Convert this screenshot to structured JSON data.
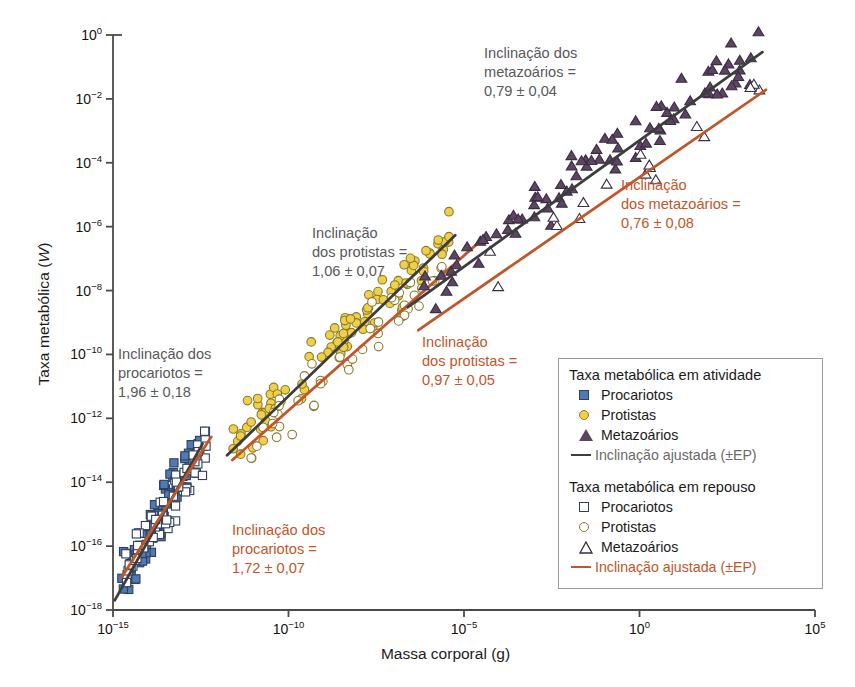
{
  "chart_data": {
    "type": "scatter",
    "title": "",
    "xlabel": "Massa corporal (g)",
    "ylabel": "Taxa metabólica (W)",
    "ylabel_italic": "W",
    "xscale": "log",
    "yscale": "log",
    "xlim": [
      1e-15,
      100000.0
    ],
    "ylim": [
      1e-18,
      1.0
    ],
    "xticks": [
      "10-15",
      "10-10",
      "10-5",
      "100",
      "105"
    ],
    "xtick_labels": [
      {
        "mantissa": "10",
        "exponent": "−15"
      },
      {
        "mantissa": "10",
        "exponent": "−10"
      },
      {
        "mantissa": "10",
        "exponent": "−5"
      },
      {
        "mantissa": "10",
        "exponent": "0"
      },
      {
        "mantissa": "10",
        "exponent": "5"
      }
    ],
    "ytick_labels": [
      {
        "mantissa": "10",
        "exponent": "0"
      },
      {
        "mantissa": "10",
        "exponent": "−2"
      },
      {
        "mantissa": "10",
        "exponent": "−4"
      },
      {
        "mantissa": "10",
        "exponent": "−6"
      },
      {
        "mantissa": "10",
        "exponent": "−8"
      },
      {
        "mantissa": "10",
        "exponent": "−10"
      },
      {
        "mantissa": "10",
        "exponent": "−12"
      },
      {
        "mantissa": "10",
        "exponent": "−14"
      },
      {
        "mantissa": "10",
        "exponent": "−16"
      },
      {
        "mantissa": "10",
        "exponent": "−18"
      }
    ],
    "grid": false,
    "legend_position": "lower-right-inside",
    "series": [
      {
        "name": "Procariotos (atividade)",
        "marker": "filled-square",
        "color": "#4e7ab5",
        "edge": "#2f3f5c",
        "n": 70
      },
      {
        "name": "Protistas (atividade)",
        "marker": "filled-circle",
        "color": "#f0cf4b",
        "edge": "#8a7a2a",
        "n": 80
      },
      {
        "name": "Metazoários (atividade)",
        "marker": "filled-triangle",
        "color": "#5b4563",
        "edge": "#3b2c41",
        "n": 70
      },
      {
        "name": "Procariotos (repouso)",
        "marker": "open-square",
        "color": "#ffffff",
        "edge": "#2f3f5c",
        "n": 60
      },
      {
        "name": "Protistas (repouso)",
        "marker": "open-circle",
        "color": "#ffffff",
        "edge": "#8a7a2a",
        "n": 40
      },
      {
        "name": "Metazoários (repouso)",
        "marker": "open-triangle",
        "color": "#ffffff",
        "edge": "#3b2c41",
        "n": 16
      }
    ],
    "fitted_lines": [
      {
        "group": "procariotos",
        "state": "atividade",
        "slope": 1.96,
        "se": 0.18,
        "color": "#3d3d3d"
      },
      {
        "group": "procariotos",
        "state": "repouso",
        "slope": 1.72,
        "se": 0.07,
        "color": "#c0562a"
      },
      {
        "group": "protistas",
        "state": "atividade",
        "slope": 1.06,
        "se": 0.07,
        "color": "#3d3d3d"
      },
      {
        "group": "protistas",
        "state": "repouso",
        "slope": 0.97,
        "se": 0.05,
        "color": "#c0562a"
      },
      {
        "group": "metazoarios",
        "state": "atividade",
        "slope": 0.79,
        "se": 0.04,
        "color": "#3d3d3d"
      },
      {
        "group": "metazoarios",
        "state": "repouso",
        "slope": 0.76,
        "se": 0.08,
        "color": "#c0562a"
      }
    ]
  },
  "annotations": {
    "metazoarios_ativo": "Inclinação dos\nmetazoários =\n0,79 ± 0,04",
    "metazoarios_repouso": "Inclinação\ndos metazoários =\n0,76 ± 0,08",
    "protistas_ativo": "Inclinação\ndos protistas =\n1,06 ± 0,07",
    "protistas_repouso": "Inclinação\ndos protistas =\n0,97 ± 0,05",
    "procariotos_ativo": "Inclinação dos\nprocariotos =\n1,96 ± 0,18",
    "procariotos_repouso": "Inclinação dos\nprocariotos =\n1,72 ± 0,07"
  },
  "axes": {
    "y_title_prefix": "Taxa metabólica  (",
    "y_title_italic": "W",
    "y_title_suffix": ")",
    "x_title": "Massa corporal (g)"
  },
  "legend": {
    "group_active_title": "Taxa metabólica em atividade",
    "group_rest_title": "Taxa metabólica em repouso",
    "active": {
      "procariotos": "Procariotos",
      "protistas": "Protistas",
      "metazoarios": "Metazoários",
      "fit": "Inclinação ajustada (±EP)"
    },
    "rest": {
      "procariotos": "Procariotos",
      "protistas": "Protistas",
      "metazoarios": "Metazoários",
      "fit": "Inclinação ajustada  (±EP)"
    }
  },
  "colors": {
    "prokaryote_fill": "#4e7ab5",
    "prokaryote_edge": "#2f3f5c",
    "protist_fill": "#f0cf4b",
    "protist_edge": "#8a7a2a",
    "metazoan_fill": "#5b4563",
    "metazoan_edge": "#3b2c41",
    "fit_active": "#3d3d3d",
    "fit_rest": "#c0562a",
    "annot_gray": "#58585a",
    "annot_orange": "#c0562a",
    "axis": "#4a4a4a"
  }
}
